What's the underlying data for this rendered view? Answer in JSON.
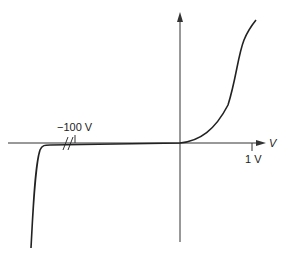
{
  "diagram": {
    "x_axis_label": "V",
    "y_axis_label": "",
    "annotations": {
      "reverse_breakdown": "−100 V",
      "forward_tick": "1 V"
    },
    "colors": {
      "curve": "#222222",
      "axes": "#333333",
      "background": "#ffffff"
    }
  }
}
